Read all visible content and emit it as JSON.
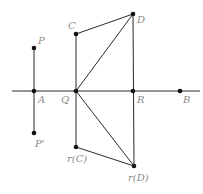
{
  "diagram": {
    "axis": {
      "x1": 12,
      "y1": 91,
      "x2": 200,
      "y2": 91
    },
    "points": [
      {
        "id": "P",
        "label": "P",
        "x": 34,
        "y": 48,
        "lx": 38,
        "ly": 44
      },
      {
        "id": "A",
        "label": "A",
        "x": 34,
        "y": 91,
        "lx": 38,
        "ly": 103
      },
      {
        "id": "P_prime",
        "label": "P'",
        "x": 34,
        "y": 133,
        "lx": 35,
        "ly": 147
      },
      {
        "id": "C",
        "label": "C",
        "x": 76,
        "y": 34,
        "lx": 68,
        "ly": 29
      },
      {
        "id": "Q",
        "label": "Q",
        "x": 76,
        "y": 91,
        "lx": 61,
        "ly": 103
      },
      {
        "id": "rC",
        "label": "r(C)",
        "x": 76,
        "y": 147,
        "lx": 67,
        "ly": 162
      },
      {
        "id": "D",
        "label": "D",
        "x": 133,
        "y": 14,
        "lx": 137,
        "ly": 23
      },
      {
        "id": "R",
        "label": "R",
        "x": 133,
        "y": 91,
        "lx": 137,
        "ly": 103
      },
      {
        "id": "rD",
        "label": "r(D)",
        "x": 134,
        "y": 166,
        "lx": 128,
        "ly": 181
      },
      {
        "id": "B",
        "label": "B",
        "x": 180,
        "y": 91,
        "lx": 183,
        "ly": 103
      }
    ],
    "segments": [
      {
        "from": "P",
        "to": "P_prime"
      },
      {
        "from": "C",
        "to": "rC"
      },
      {
        "from": "D",
        "to": "rD"
      },
      {
        "from": "C",
        "to": "D"
      },
      {
        "from": "Q",
        "to": "D"
      },
      {
        "from": "Q",
        "to": "rD"
      },
      {
        "from": "rC",
        "to": "rD"
      }
    ],
    "colors": {
      "line": "#2a2a2a",
      "point": "#111111",
      "label": "#8a8a8a"
    }
  }
}
